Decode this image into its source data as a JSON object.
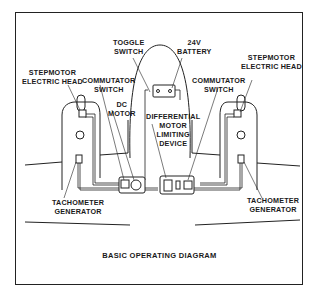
{
  "diagram": {
    "caption": "BASIC OPERATING DIAGRAM",
    "labels": {
      "toggle_switch": [
        "TOGGLE",
        "SWITCH"
      ],
      "battery": [
        "24V",
        "BATTERY"
      ],
      "stepmotor_left": [
        "STEPMOTOR",
        "ELECTRIC HEAD"
      ],
      "stepmotor_right": [
        "STEPMOTOR",
        "ELECTRIC HEAD"
      ],
      "commutator_left": [
        "COMMUTATOR",
        "SWITCH"
      ],
      "commutator_right": [
        "COMMUTATOR",
        "SWITCH"
      ],
      "dc_motor": [
        "DC",
        "MOTOR"
      ],
      "differential": [
        "DIFFERENTIAL",
        "MOTOR",
        "LIMITING",
        "DEVICE"
      ],
      "tacho_left": [
        "TACHOMETER",
        "GENERATOR"
      ],
      "tacho_right": [
        "TACHOMETER",
        "GENERATOR"
      ]
    },
    "colors": {
      "line": "#222222",
      "background": "#ffffff"
    }
  }
}
